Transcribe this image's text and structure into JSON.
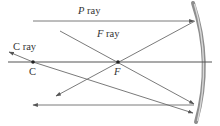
{
  "diagram": {
    "type": "concave-mirror-ray-diagram",
    "labels": {
      "p_ray_letter": "P",
      "p_ray_word": " ray",
      "f_ray_letter": "F",
      "f_ray_word": " ray",
      "c_ray_letter": "C",
      "c_ray_word": " ray",
      "c_point": "C",
      "f_point": "F"
    },
    "colors": {
      "ray": "#6b6b6b",
      "axis": "#555555",
      "mirror": "#9a9a9a",
      "mirror_edge": "#d8d8d8",
      "label": "#333333",
      "point": "#222222"
    }
  }
}
